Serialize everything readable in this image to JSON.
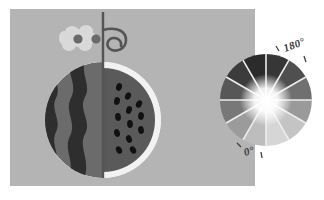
{
  "figure": {
    "background_color": "#ffffff",
    "panel": {
      "name": "illustration-panel",
      "fill": "#b4b4b4",
      "x": 10,
      "y": 9,
      "width": 245,
      "height": 177
    }
  },
  "watermelon": {
    "name": "watermelon-illustration",
    "center_x": 103,
    "center_y": 120,
    "radius": 58,
    "rind_outline_color": "#f2f2f2",
    "left_half": {
      "label": "striped-rind-half",
      "base_color": "#6b6b6b",
      "stripe_color": "#2e2e2e",
      "stripe_count": 2
    },
    "right_half": {
      "label": "seeded-flesh-half",
      "flesh_color": "#5a5a5a",
      "rind_color": "#f2f2f2",
      "seed_color": "#111111",
      "seed_count": 13
    },
    "stem": {
      "label": "stem-and-tendril",
      "color": "#555555",
      "tendril": "curled-loop"
    },
    "flower": {
      "label": "blossom",
      "petal_color": "#d9d9d9",
      "center_color": "#6a6a6a",
      "center_count": 2
    }
  },
  "color_wheel": {
    "name": "angular-color-wheel",
    "center_x": 266,
    "center_y": 100,
    "outer_radius": 46,
    "segment_count": 12,
    "center_highlight_color": "#ffffff",
    "spoke_color": "#ededed",
    "segments": [
      {
        "index": 0,
        "angle_deg": 0,
        "color": "#707070"
      },
      {
        "index": 1,
        "angle_deg": 30,
        "color": "#4f4f4f"
      },
      {
        "index": 2,
        "angle_deg": 60,
        "color": "#363636"
      },
      {
        "index": 3,
        "angle_deg": 90,
        "color": "#2b2b2b"
      },
      {
        "index": 4,
        "angle_deg": 120,
        "color": "#3c3c3c"
      },
      {
        "index": 5,
        "angle_deg": 150,
        "color": "#575757"
      },
      {
        "index": 6,
        "angle_deg": 180,
        "color": "#787878"
      },
      {
        "index": 7,
        "angle_deg": 210,
        "color": "#9b9b9b"
      },
      {
        "index": 8,
        "angle_deg": 240,
        "color": "#bdbdbd"
      },
      {
        "index": 9,
        "angle_deg": 270,
        "color": "#d6d6d6"
      },
      {
        "index": 10,
        "angle_deg": 300,
        "color": "#c4c4c4"
      },
      {
        "index": 11,
        "angle_deg": 330,
        "color": "#9a9a9a"
      }
    ],
    "labels": {
      "upper": "180°",
      "lower": "0°"
    },
    "tick_color": "#3f3f3f",
    "label_color": "#3a3a3a"
  }
}
